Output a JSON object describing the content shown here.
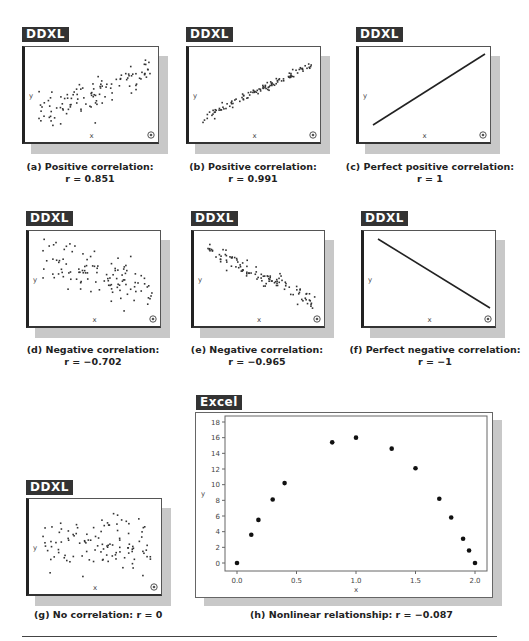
{
  "panels": [
    {
      "id": "a",
      "tag": "DDXL",
      "caption_line1": "(a) Positive correlation:",
      "caption_line2": "r = 0.851",
      "r": 0.851,
      "type": "scatter"
    },
    {
      "id": "b",
      "tag": "DDXL",
      "caption_line1": "(b) Positive correlation:",
      "caption_line2": "r = 0.991",
      "r": 0.991,
      "type": "scatter"
    },
    {
      "id": "c",
      "tag": "DDXL",
      "caption_line1": "(c) Perfect positive correlation:",
      "caption_line2": "r = 1",
      "r": 1,
      "type": "line"
    },
    {
      "id": "d",
      "tag": "DDXL",
      "caption_line1": "(d) Negative correlation:",
      "caption_line2": "r = −0.702",
      "r": -0.702,
      "type": "scatter"
    },
    {
      "id": "e",
      "tag": "DDXL",
      "caption_line1": "(e) Negative correlation:",
      "caption_line2": "r = −0.965",
      "r": -0.965,
      "type": "scatter"
    },
    {
      "id": "f",
      "tag": "DDXL",
      "caption_line1": "(f) Perfect negative correlation:",
      "caption_line2": "r = −1",
      "r": -1,
      "type": "line"
    },
    {
      "id": "g",
      "tag": "DDXL",
      "caption_line1": "(g) No correlation: r = 0",
      "r": 0,
      "type": "scatter"
    },
    {
      "id": "h",
      "tag": "Excel",
      "caption_line1": "(h) Nonlinear relationship: r = −0.087",
      "r": -0.087,
      "type": "scatter"
    }
  ],
  "axis_labels": {
    "x": "x",
    "y": "y"
  },
  "chart_data": [
    {
      "type": "scatter",
      "title": "(a) Positive correlation: r = 0.851",
      "xlabel": "x",
      "ylabel": "y",
      "r": 0.851
    },
    {
      "type": "scatter",
      "title": "(b) Positive correlation: r = 0.991",
      "xlabel": "x",
      "ylabel": "y",
      "r": 0.991
    },
    {
      "type": "line",
      "title": "(c) Perfect positive correlation: r = 1",
      "xlabel": "x",
      "ylabel": "y",
      "r": 1
    },
    {
      "type": "scatter",
      "title": "(d) Negative correlation: r = −0.702",
      "xlabel": "x",
      "ylabel": "y",
      "r": -0.702
    },
    {
      "type": "scatter",
      "title": "(e) Negative correlation: r = −0.965",
      "xlabel": "x",
      "ylabel": "y",
      "r": -0.965
    },
    {
      "type": "line",
      "title": "(f) Perfect negative correlation: r = −1",
      "xlabel": "x",
      "ylabel": "y",
      "r": -1
    },
    {
      "type": "scatter",
      "title": "(g) No correlation: r = 0",
      "xlabel": "x",
      "ylabel": "y",
      "r": 0
    },
    {
      "type": "scatter",
      "title": "(h) Nonlinear relationship: r = −0.087",
      "xlabel": "x",
      "ylabel": "y",
      "xlim": [
        0,
        2
      ],
      "ylim": [
        0,
        18
      ],
      "xticks": [
        "0.0",
        "0.5",
        "1.0",
        "1.5",
        "2.0"
      ],
      "yticks": [
        "0",
        "2",
        "4",
        "6",
        "8",
        "10",
        "12",
        "14",
        "16",
        "18"
      ],
      "x": [
        0.0,
        0.12,
        0.18,
        0.3,
        0.4,
        0.8,
        1.0,
        1.3,
        1.5,
        1.7,
        1.8,
        1.9,
        1.95,
        2.0
      ],
      "y": [
        0.0,
        3.6,
        5.5,
        8.1,
        10.2,
        15.4,
        16.0,
        14.6,
        12.1,
        8.2,
        5.8,
        3.1,
        1.6,
        0.0
      ],
      "grid": false,
      "r": -0.087
    }
  ]
}
